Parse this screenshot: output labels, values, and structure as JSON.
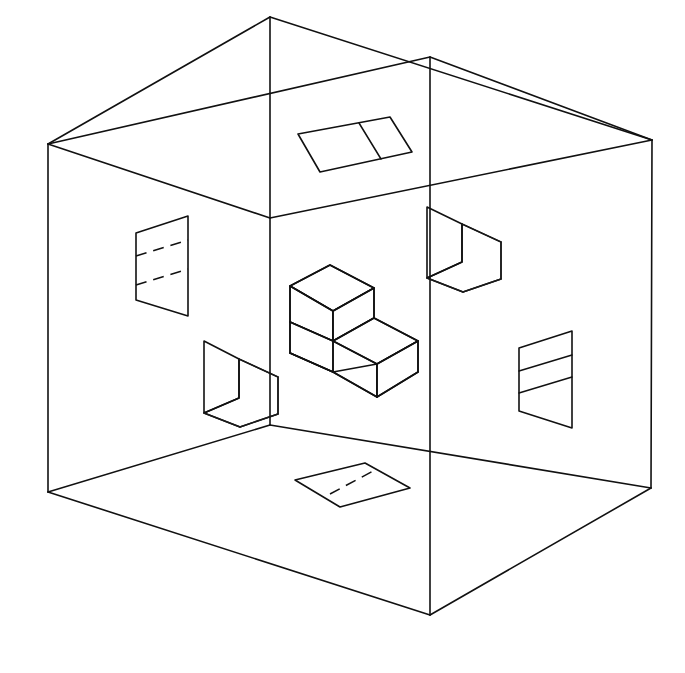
{
  "figure": {
    "type": "line-drawing",
    "background_color": "#ffffff",
    "line_color": "#111111",
    "width": 685,
    "height": 673
  },
  "geometry": {
    "box": {
      "name": "room-shell",
      "description": "Open isometric rectangular room drawn as wireframe: two visible inner walls, floor, and ceiling rim.",
      "vertices": {
        "top_apex": [
          270,
          17
        ],
        "left_top": [
          48,
          144
        ],
        "right_top": [
          652,
          140
        ],
        "back_top": [
          432,
          57
        ],
        "left_bottom": [
          48,
          492
        ],
        "right_bottom": [
          651,
          488
        ],
        "front_bottom": [
          430,
          615
        ],
        "center_floor": [
          270,
          425
        ],
        "center_ceiling": [
          270,
          17
        ]
      },
      "ceiling_rim": [
        [
          270,
          17
        ],
        [
          48,
          144
        ],
        [
          652,
          140
        ],
        [
          430,
          57
        ]
      ],
      "center_vertical": [
        [
          270,
          17
        ],
        [
          270,
          425
        ]
      ],
      "floor_left_edge": [
        [
          48,
          492
        ],
        [
          270,
          425
        ]
      ],
      "floor_right_edge": [
        [
          270,
          425
        ],
        [
          651,
          488
        ]
      ],
      "left_wall_top_edge": [
        [
          48,
          144
        ],
        [
          270,
          218
        ]
      ],
      "right_wall_top_edge": [
        [
          270,
          218
        ],
        [
          652,
          140
        ]
      ],
      "left_outer_vertical": [
        [
          48,
          144
        ],
        [
          48,
          492
        ]
      ],
      "right_outer_vertical": [
        [
          652,
          140
        ],
        [
          651,
          488
        ]
      ],
      "front_bottom_left": [
        [
          48,
          492
        ],
        [
          430,
          615
        ]
      ],
      "front_bottom_right": [
        [
          430,
          615
        ],
        [
          651,
          488
        ]
      ],
      "front_vertical": [
        [
          430,
          57
        ],
        [
          430,
          615
        ]
      ]
    },
    "panels": [
      {
        "name": "ceiling-panel",
        "location": "ceiling",
        "shape": "parallelogram",
        "divider": "solid",
        "outline": [
          [
            298,
            134
          ],
          [
            390,
            117
          ],
          [
            412,
            152
          ],
          [
            320,
            172
          ]
        ]
      },
      {
        "name": "left-wall-panel",
        "location": "left-wall",
        "shape": "parallelogram",
        "divider": "dashed-double",
        "dashed_lines": 2,
        "outline": [
          [
            136,
            233
          ],
          [
            188,
            216
          ],
          [
            188,
            316
          ],
          [
            136,
            300
          ]
        ]
      },
      {
        "name": "right-wall-panel",
        "location": "right-wall",
        "shape": "parallelogram",
        "divider": "solid-double",
        "solid_lines": 2,
        "outline": [
          [
            519,
            348
          ],
          [
            572,
            331
          ],
          [
            572,
            428
          ],
          [
            519,
            411
          ]
        ]
      },
      {
        "name": "floor-panel",
        "location": "floor",
        "shape": "parallelogram",
        "divider": "dashed",
        "outline": [
          [
            295,
            480
          ],
          [
            365,
            463
          ],
          [
            410,
            488
          ],
          [
            340,
            507
          ]
        ]
      },
      {
        "name": "left-standing-panel",
        "location": "floor-left",
        "shape": "bent-flap",
        "description": "Vertical flap panel bent at corner, left side of room"
      },
      {
        "name": "right-standing-panel",
        "location": "wall-right-upper",
        "shape": "bent-flap",
        "description": "Vertical flap panel bent at corner, upper right of room"
      },
      {
        "name": "center-step-block",
        "location": "center",
        "shape": "l-shaped-stepped-solid",
        "description": "Stepped L-shaped block at room center with an upper cube and lower extended step"
      }
    ]
  },
  "labels": {
    "none_visible": ""
  }
}
